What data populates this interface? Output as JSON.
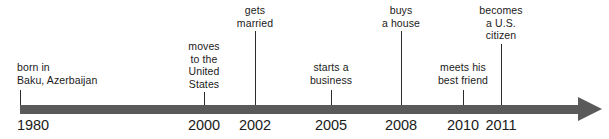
{
  "figure": {
    "type": "timeline",
    "title": "",
    "axis": {
      "start_year": "1980",
      "end_year": "2011",
      "color": "#5a5a5a",
      "arrow_direction": "right"
    },
    "text_color": "#1a1a1a",
    "background_color": "#ffffff"
  },
  "events": [
    {
      "year": "1980",
      "label": "born in\nBaku, Azerbaijan",
      "align": "left",
      "tick_x": 20,
      "label_x": 17,
      "label_y": 61,
      "tick_top": 90,
      "tick_height": 15
    },
    {
      "year": "2000",
      "label": "moves\nto the\nUnited\nStates",
      "align": "center",
      "tick_x": 204,
      "label_x": 204,
      "label_y": 40,
      "tick_top": 92,
      "tick_height": 13
    },
    {
      "year": "2002",
      "label": "gets\nmarried",
      "align": "center",
      "tick_x": 255,
      "label_x": 255,
      "label_y": 4,
      "tick_top": 31,
      "tick_height": 74
    },
    {
      "year": "2005",
      "label": "starts a\nbusiness",
      "align": "center",
      "tick_x": 331,
      "label_x": 331,
      "label_y": 61,
      "tick_top": 90,
      "tick_height": 15
    },
    {
      "year": "2008",
      "label": "buys\na house",
      "align": "center",
      "tick_x": 401,
      "label_x": 401,
      "label_y": 4,
      "tick_top": 31,
      "tick_height": 74
    },
    {
      "year": "2010",
      "label": "meets his\nbest friend",
      "align": "center",
      "tick_x": 463,
      "label_x": 463,
      "label_y": 61,
      "tick_top": 90,
      "tick_height": 15
    },
    {
      "year": "2011",
      "label": "becomes\na U.S.\ncitizen",
      "align": "center",
      "tick_x": 501,
      "label_x": 501,
      "label_y": 4,
      "tick_top": 44,
      "tick_height": 61
    }
  ]
}
